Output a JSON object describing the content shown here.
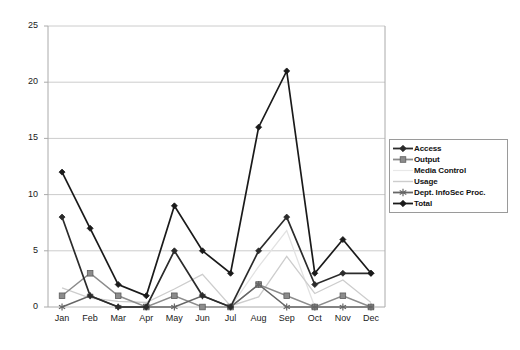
{
  "chart_data": {
    "type": "line",
    "title": "",
    "subtitle": "",
    "xlabel": "",
    "ylabel": "",
    "categories": [
      "Jan",
      "Feb",
      "Mar",
      "Apr",
      "May",
      "Jun",
      "Jul",
      "Aug",
      "Sep",
      "Oct",
      "Nov",
      "Dec"
    ],
    "ylim": [
      0,
      25
    ],
    "yticks": [
      0,
      5,
      10,
      15,
      20,
      25
    ],
    "grid": "horizontal",
    "legend_position": "right",
    "series": [
      {
        "name": "Access",
        "color": "#2b2b2b",
        "marker": "diamond",
        "values": [
          8,
          1,
          0,
          0,
          5,
          1,
          0,
          5,
          8,
          2,
          3,
          3
        ]
      },
      {
        "name": "Output",
        "color": "#8c8c8c",
        "marker": "square",
        "values": [
          1,
          3,
          1,
          0,
          1,
          0,
          0,
          2,
          1,
          0,
          1,
          0
        ]
      },
      {
        "name": "Media Control",
        "color": "#e2e2e2",
        "marker": "none",
        "values": [
          0,
          0,
          0,
          0,
          0,
          0,
          0,
          3.6,
          6.8,
          0,
          0,
          0
        ]
      },
      {
        "name": "Usage",
        "color": "#cdcdcd",
        "marker": "none",
        "values": [
          1.7,
          0.8,
          0.5,
          0.4,
          1.6,
          2.9,
          0.1,
          0.9,
          4.5,
          1.2,
          2.4,
          0.4
        ]
      },
      {
        "name": "Dept. InfoSec Proc.",
        "color": "#666666",
        "marker": "asterisk",
        "values": [
          0,
          1,
          0,
          0,
          0,
          1,
          0,
          2,
          0,
          0,
          0,
          0
        ]
      },
      {
        "name": "Total",
        "color": "#1a1a1a",
        "marker": "diamond",
        "values": [
          12,
          7,
          2,
          1,
          9,
          5,
          3,
          16,
          21,
          3,
          6,
          3
        ]
      }
    ]
  },
  "axis": {
    "y_labels": [
      "25",
      "20",
      "15",
      "10",
      "5",
      "0"
    ],
    "x_labels": [
      "Jan",
      "Feb",
      "Mar",
      "Apr",
      "May",
      "Jun",
      "Jul",
      "Aug",
      "Sep",
      "Oct",
      "Nov",
      "Dec"
    ]
  },
  "legend": {
    "entries": [
      {
        "label": "Access",
        "color": "#2b2b2b",
        "marker": "diamond"
      },
      {
        "label": "Output",
        "color": "#8c8c8c",
        "marker": "square"
      },
      {
        "label": "Media Control",
        "color": "#e8e8e8",
        "marker": "none"
      },
      {
        "label": "Usage",
        "color": "#cdcdcd",
        "marker": "none"
      },
      {
        "label": "Dept. InfoSec Proc.",
        "color": "#666666",
        "marker": "asterisk"
      },
      {
        "label": "Total",
        "color": "#1a1a1a",
        "marker": "diamond"
      }
    ]
  },
  "colors": {
    "plot_border": "#aaaaaa",
    "gridline": "#cccccc",
    "background": "#ffffff",
    "text": "#1a1a1a"
  }
}
